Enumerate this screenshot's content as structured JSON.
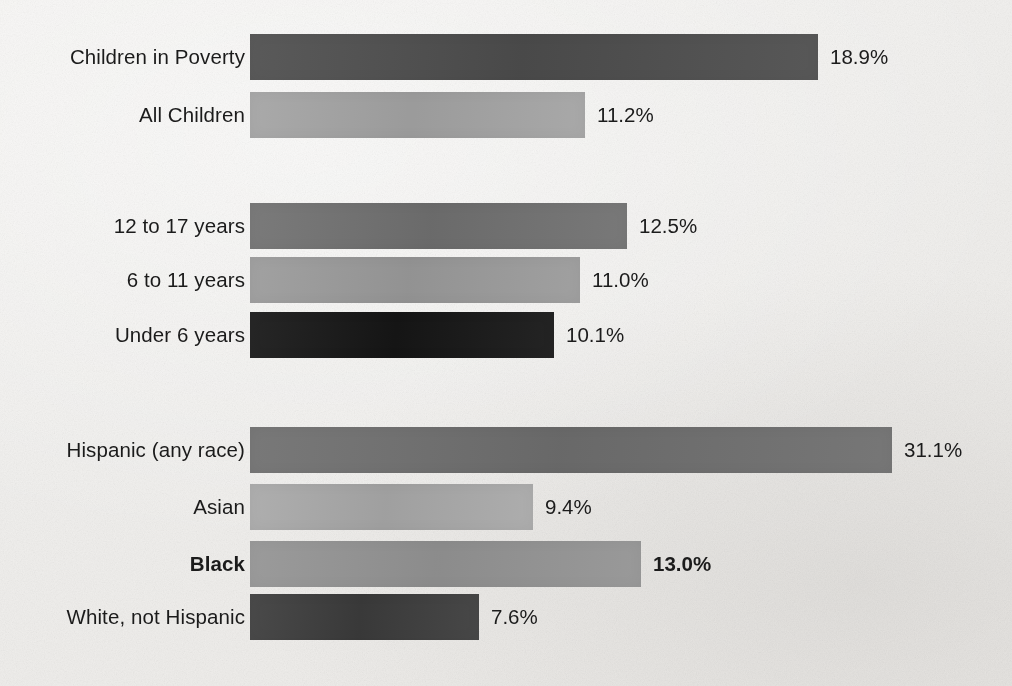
{
  "chart_data": {
    "type": "bar",
    "orientation": "horizontal",
    "title": "",
    "subtitle": "",
    "xlabel": "",
    "ylabel": "",
    "grid": false,
    "legend": null,
    "value_suffix": "%",
    "axis_note": "no axis line or tick labels drawn; values printed at bar ends",
    "pixels_per_unit": 30.1,
    "bar_origin_x_px": 250,
    "categories": [
      "Children in Poverty",
      "All Children",
      "12 to 17 years",
      "6 to 11 years",
      "Under 6 years",
      "Hispanic (any race)",
      "Asian",
      "Black",
      "White, not Hispanic"
    ],
    "values": [
      18.9,
      11.2,
      12.5,
      11.0,
      10.1,
      31.1,
      9.4,
      13.0,
      7.6
    ],
    "labels": [
      "18.9%",
      "11.2%",
      "12.5%",
      "11.0%",
      "10.1%",
      "31.1%",
      "9.4%",
      "13.0%",
      "7.6%"
    ],
    "groups": [
      {
        "name": "overall",
        "bars": [
          {
            "label": "Children in Poverty",
            "value": 18.9,
            "value_label": "18.9%",
            "bar_px": 568,
            "color": "#4d4d4d",
            "emphasis": false,
            "top_px": 34
          },
          {
            "label": "All Children",
            "value": 11.2,
            "value_label": "11.2%",
            "bar_px": 335,
            "color": "#a3a3a3",
            "emphasis": false,
            "top_px": 92
          }
        ]
      },
      {
        "name": "by-age",
        "bars": [
          {
            "label": "12 to 17 years",
            "value": 12.5,
            "value_label": "12.5%",
            "bar_px": 377,
            "color": "#707070",
            "emphasis": false,
            "top_px": 203
          },
          {
            "label": "6 to 11 years",
            "value": 11.0,
            "value_label": "11.0%",
            "bar_px": 330,
            "color": "#9a9a9a",
            "emphasis": false,
            "top_px": 257
          },
          {
            "label": "Under 6 years",
            "value": 10.1,
            "value_label": "10.1%",
            "bar_px": 304,
            "color": "#161616",
            "emphasis": false,
            "top_px": 312
          }
        ]
      },
      {
        "name": "by-race-ethnicity",
        "bars": [
          {
            "label": "Hispanic (any race)",
            "value": 31.1,
            "value_label": "31.1%",
            "bar_px": 642,
            "color": "#6e6e6e",
            "emphasis": false,
            "top_px": 427
          },
          {
            "label": "Asian",
            "value": 9.4,
            "value_label": "9.4%",
            "bar_px": 283,
            "color": "#a8a8a8",
            "emphasis": false,
            "top_px": 484
          },
          {
            "label": "Black",
            "value": 13.0,
            "value_label": "13.0%",
            "bar_px": 391,
            "color": "#939393",
            "emphasis": true,
            "top_px": 541
          },
          {
            "label": "White, not Hispanic",
            "value": 7.6,
            "value_label": "7.6%",
            "bar_px": 229,
            "color": "#3c3c3c",
            "emphasis": false,
            "top_px": 594
          }
        ]
      }
    ]
  },
  "colors": {
    "page_background": "#f2f1ef",
    "text": "#1b1b1b",
    "bar_darkest": "#161616",
    "bar_lightest": "#a8a8a8"
  }
}
